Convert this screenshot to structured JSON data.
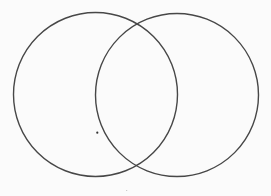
{
  "diagram": {
    "type": "venn",
    "background": "#fbfbfb",
    "stroke_color": "#474747",
    "stroke_width": 1.4,
    "circles": [
      {
        "name": "left-circle",
        "cx": 95.5,
        "cy": 94.5,
        "r": 82
      },
      {
        "name": "right-circle",
        "cx": 177,
        "cy": 95,
        "r": 81.5
      }
    ],
    "dots": [
      {
        "name": "marker-dot",
        "x": 97.3,
        "y": 132.7,
        "r": 1.1,
        "color": "#333333"
      },
      {
        "name": "faint-mark",
        "x": 126.7,
        "y": 190.5,
        "r": 0.6,
        "color": "#bbbbbb"
      }
    ]
  }
}
